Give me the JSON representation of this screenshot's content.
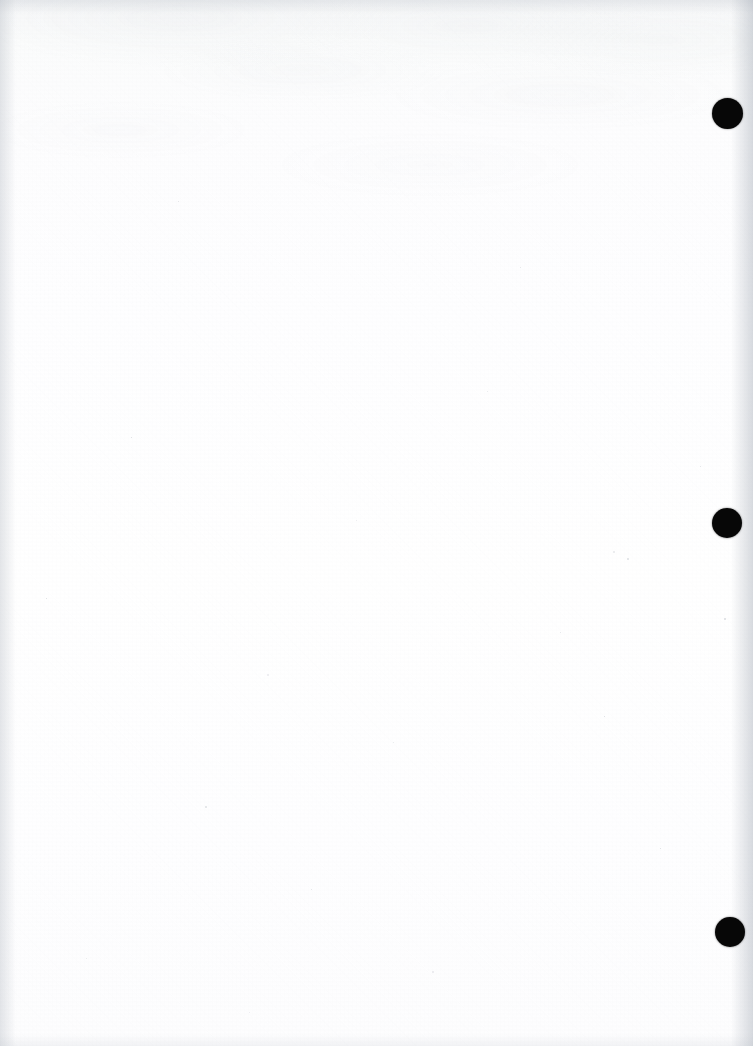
{
  "document": {
    "kind": "scanned-page",
    "page_state": "blank",
    "visible_text": "",
    "width_px": 753,
    "height_px": 1046,
    "background_color": "#fefeff",
    "paper_tone": "#fdfdfe"
  },
  "marks": {
    "label": "registration-marks",
    "color": "#070707",
    "count": 3,
    "items": [
      {
        "name": "mark-top",
        "cx": 727,
        "cy": 113,
        "d": 31
      },
      {
        "name": "mark-middle",
        "cx": 727,
        "cy": 523,
        "d": 30
      },
      {
        "name": "mark-bottom",
        "cx": 730,
        "cy": 932,
        "d": 30
      }
    ]
  },
  "artifacts": {
    "bleed_through_region": "upper",
    "edge_shadow_color": "#9aa2ae",
    "speck_color": "#b9bec6",
    "specks": [
      {
        "x": 267,
        "y": 674,
        "s": 2.4
      },
      {
        "x": 613,
        "y": 551,
        "s": 2.2
      },
      {
        "x": 627,
        "y": 558,
        "s": 1.6
      },
      {
        "x": 724,
        "y": 618,
        "s": 1.5
      },
      {
        "x": 131,
        "y": 437,
        "s": 1.4
      },
      {
        "x": 356,
        "y": 520,
        "s": 1.3
      },
      {
        "x": 487,
        "y": 391,
        "s": 1.3
      },
      {
        "x": 205,
        "y": 806,
        "s": 1.5
      },
      {
        "x": 311,
        "y": 889,
        "s": 1.4
      },
      {
        "x": 604,
        "y": 716,
        "s": 1.3
      },
      {
        "x": 432,
        "y": 971,
        "s": 1.5
      },
      {
        "x": 86,
        "y": 958,
        "s": 1.2
      },
      {
        "x": 520,
        "y": 267,
        "s": 1.3
      },
      {
        "x": 178,
        "y": 201,
        "s": 1.4
      },
      {
        "x": 660,
        "y": 848,
        "s": 1.3
      },
      {
        "x": 249,
        "y": 1012,
        "s": 1.3
      },
      {
        "x": 393,
        "y": 742,
        "s": 1.2
      },
      {
        "x": 560,
        "y": 632,
        "s": 1.2
      },
      {
        "x": 700,
        "y": 466,
        "s": 1.2
      },
      {
        "x": 46,
        "y": 598,
        "s": 1.2
      }
    ]
  }
}
